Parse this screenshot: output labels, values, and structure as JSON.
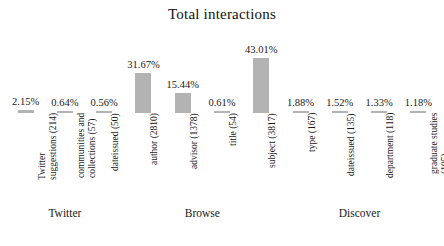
{
  "chart_data": {
    "type": "bar",
    "title": "Total interactions",
    "xlabel": "",
    "ylabel": "",
    "ylim": [
      0,
      43.01
    ],
    "grid": false,
    "legend": false,
    "bar_color": "#b3b3b3",
    "value_suffix": "%",
    "categories": [
      "Twitter suggestions (214)",
      "communities and collections (57)",
      "dateissued (50)",
      "author (2810)",
      "advisor (1378)",
      "title (54)",
      "subject (3817)",
      "type (167)",
      "dateissued (135)",
      "department (118)",
      "graduate studies (105)"
    ],
    "category_lines": [
      [
        "Twitter",
        "suggestions (214)"
      ],
      [
        "communities and",
        "collections (57)"
      ],
      [
        "dateissued (50)"
      ],
      [
        "author (2810)"
      ],
      [
        "advisor (1378)"
      ],
      [
        "title (54)"
      ],
      [
        "subject (3817)"
      ],
      [
        "type (167)"
      ],
      [
        "dateissued (135)"
      ],
      [
        "department (118)"
      ],
      [
        "graduate studies",
        "(105)"
      ]
    ],
    "values": [
      2.15,
      0.64,
      0.56,
      31.67,
      15.44,
      0.61,
      43.01,
      1.88,
      1.52,
      1.33,
      1.18
    ],
    "value_labels": [
      "2.15%",
      "0.64%",
      "0.56%",
      "31.67%",
      "15.44%",
      "0.61%",
      "43.01%",
      "1.88%",
      "1.52%",
      "1.33%",
      "1.18%"
    ],
    "counts": [
      214,
      57,
      50,
      2810,
      1378,
      54,
      3817,
      167,
      135,
      118,
      105
    ],
    "groups": [
      {
        "label": "Twitter",
        "start": 0,
        "end": 2
      },
      {
        "label": "Browse",
        "start": 3,
        "end": 6
      },
      {
        "label": "Discover",
        "start": 7,
        "end": 10
      }
    ]
  }
}
